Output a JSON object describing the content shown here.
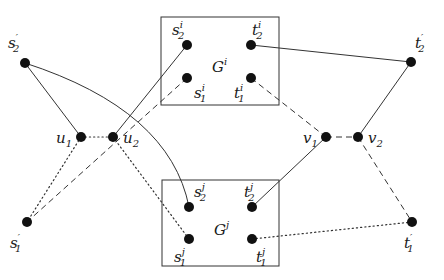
{
  "diagram": {
    "type": "graph",
    "colors": {
      "stroke": "#333333",
      "node": "#111111",
      "background": "#ffffff"
    },
    "boxes": [
      {
        "id": "Gi",
        "label": "G",
        "label_sup": "i"
      },
      {
        "id": "Gj",
        "label": "G",
        "label_sup": "j"
      }
    ],
    "nodes": [
      {
        "id": "s2p",
        "base": "s",
        "sub": "2",
        "sup": "′",
        "box": null
      },
      {
        "id": "s1p",
        "base": "s",
        "sub": "1",
        "sup": "′",
        "box": null
      },
      {
        "id": "u1",
        "base": "u",
        "sub": "1",
        "sup": "",
        "box": null
      },
      {
        "id": "u2",
        "base": "u",
        "sub": "2",
        "sup": "",
        "box": null
      },
      {
        "id": "v1",
        "base": "v",
        "sub": "1",
        "sup": "",
        "box": null
      },
      {
        "id": "v2",
        "base": "v",
        "sub": "2",
        "sup": "",
        "box": null
      },
      {
        "id": "t2p",
        "base": "t",
        "sub": "2",
        "sup": "′",
        "box": null
      },
      {
        "id": "t1p",
        "base": "t",
        "sub": "1",
        "sup": "′",
        "box": null
      },
      {
        "id": "s2i",
        "base": "s",
        "sub": "2",
        "sup": "i",
        "box": "Gi"
      },
      {
        "id": "t2i",
        "base": "t",
        "sub": "2",
        "sup": "i",
        "box": "Gi"
      },
      {
        "id": "s1i",
        "base": "s",
        "sub": "1",
        "sup": "i",
        "box": "Gi"
      },
      {
        "id": "t1i",
        "base": "t",
        "sub": "1",
        "sup": "i",
        "box": "Gi"
      },
      {
        "id": "s2j",
        "base": "s",
        "sub": "2",
        "sup": "j",
        "box": "Gj"
      },
      {
        "id": "t2j",
        "base": "t",
        "sub": "2",
        "sup": "j",
        "box": "Gj"
      },
      {
        "id": "s1j",
        "base": "s",
        "sub": "1",
        "sup": "j",
        "box": "Gj"
      },
      {
        "id": "t1j",
        "base": "t",
        "sub": "1",
        "sup": "j",
        "box": "Gj"
      }
    ],
    "edges": [
      {
        "from": "s2p",
        "to": "u1",
        "style": "solid"
      },
      {
        "from": "s2p",
        "to": "s2j",
        "style": "solid",
        "curved": true
      },
      {
        "from": "u2",
        "to": "s2i",
        "style": "solid"
      },
      {
        "from": "t2i",
        "to": "t2p",
        "style": "solid"
      },
      {
        "from": "t2p",
        "to": "v2",
        "style": "solid"
      },
      {
        "from": "t2j",
        "to": "v1",
        "style": "solid"
      },
      {
        "from": "u1",
        "to": "u2",
        "style": "dotted"
      },
      {
        "from": "u1",
        "to": "s1p",
        "style": "dotted"
      },
      {
        "from": "u2",
        "to": "s1j",
        "style": "dotted"
      },
      {
        "from": "t1j",
        "to": "t1p",
        "style": "dotted"
      },
      {
        "from": "s1i",
        "to": "s1p",
        "style": "dashed"
      },
      {
        "from": "t1i",
        "to": "v1",
        "style": "dashed"
      },
      {
        "from": "v1",
        "to": "v2",
        "style": "dashed"
      },
      {
        "from": "v2",
        "to": "t1p",
        "style": "dashed"
      }
    ]
  }
}
